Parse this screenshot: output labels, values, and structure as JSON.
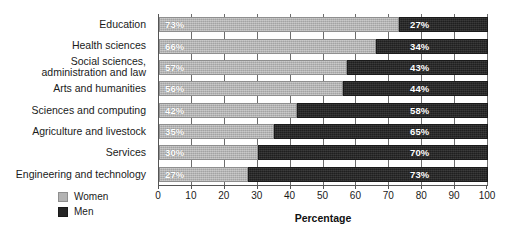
{
  "chart_data": {
    "type": "bar",
    "orientation": "horizontal",
    "stacked": true,
    "title": "",
    "xlabel": "Percentage",
    "ylabel": "",
    "xlim": [
      0,
      100
    ],
    "xticks": [
      0,
      10,
      20,
      30,
      40,
      50,
      60,
      70,
      80,
      90,
      100
    ],
    "xtick_labels": [
      "0",
      "10",
      "20",
      "30",
      "40",
      "50",
      "60",
      "70",
      "80",
      "90",
      "100"
    ],
    "grid": true,
    "legend_position": "bottom-left",
    "categories": [
      "Education",
      "Health sciences",
      "Social sciences, administration and law",
      "Arts and humanities",
      "Sciences and computing",
      "Agriculture and livestock",
      "Services",
      "Engineering and technology"
    ],
    "category_lines": [
      [
        "Education"
      ],
      [
        "Health sciences"
      ],
      [
        "Social sciences,",
        "administration and law"
      ],
      [
        "Arts and humanities"
      ],
      [
        "Sciences and computing"
      ],
      [
        "Agriculture and livestock"
      ],
      [
        "Services"
      ],
      [
        "Engineering and technology"
      ]
    ],
    "series": [
      {
        "name": "Women",
        "color": "#b3b3b3",
        "values": [
          73,
          66,
          57,
          56,
          42,
          35,
          30,
          27
        ],
        "labels": [
          "73%",
          "66%",
          "57%",
          "56%",
          "42%",
          "35%",
          "30%",
          "27%"
        ]
      },
      {
        "name": "Men",
        "color": "#262626",
        "values": [
          27,
          34,
          43,
          44,
          58,
          65,
          70,
          73
        ],
        "labels": [
          "27%",
          "34%",
          "43%",
          "44%",
          "58%",
          "65%",
          "70%",
          "73%"
        ]
      }
    ]
  },
  "legend": {
    "items": [
      {
        "label": "Women",
        "swatch": "women-swatch"
      },
      {
        "label": "Men",
        "swatch": "men-swatch"
      }
    ]
  },
  "axis": {
    "x_title": "Percentage"
  }
}
